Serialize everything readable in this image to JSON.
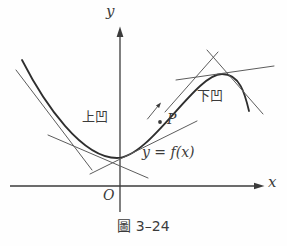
{
  "figure": {
    "caption": "圖 3–24",
    "labels": {
      "y_axis": "y",
      "x_axis": "x",
      "origin": "O",
      "concave_up": "上凹",
      "concave_down": "下凹",
      "curve_equation": "y = f(x)",
      "point": "P"
    },
    "colors": {
      "ink": "#3b3b3b",
      "tangent": "#5c5c5c",
      "background": "#fefefe"
    }
  }
}
